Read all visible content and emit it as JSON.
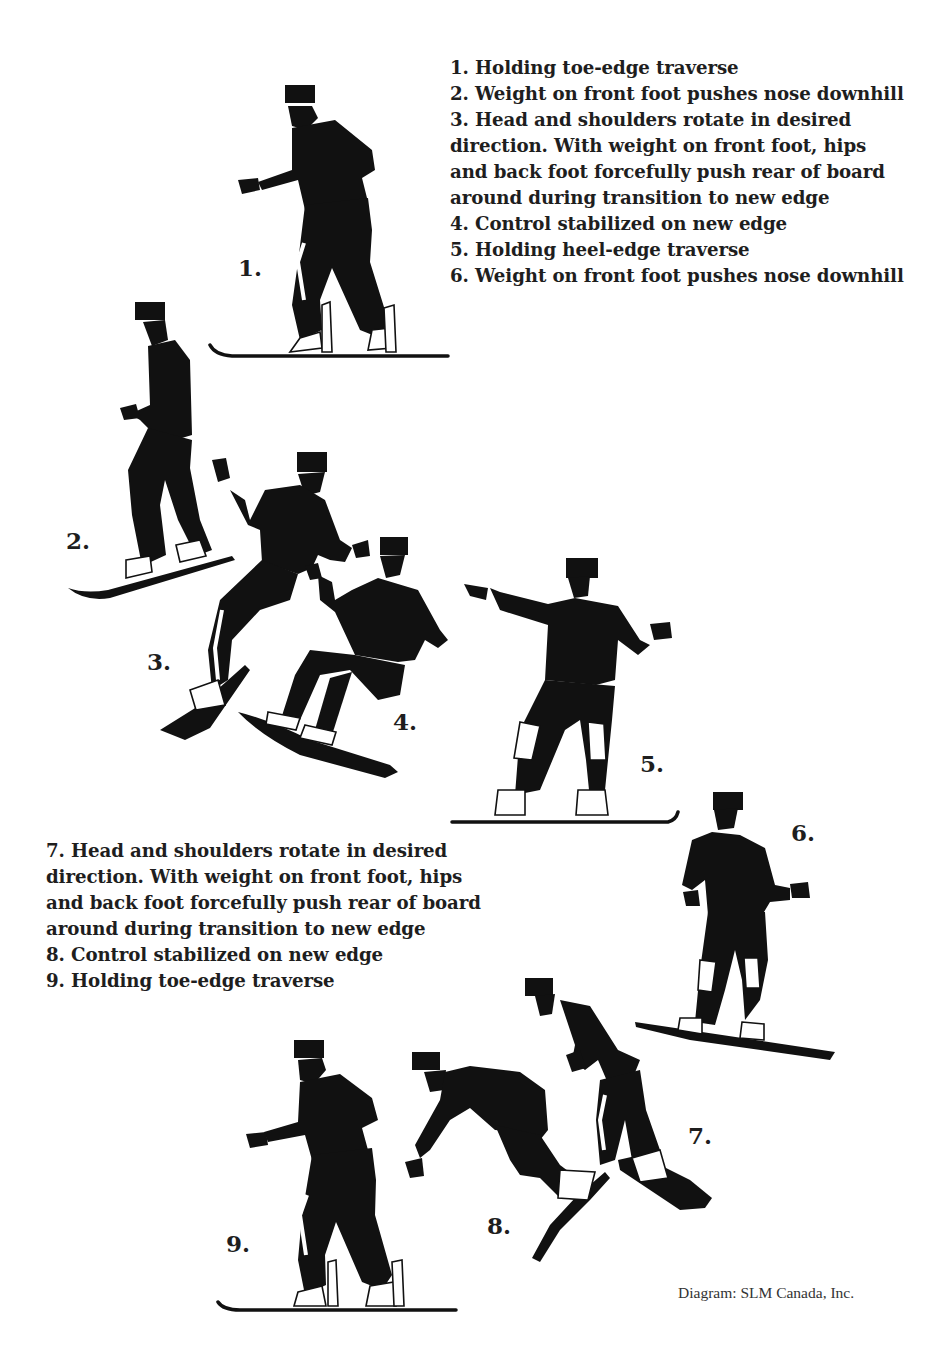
{
  "diagram": {
    "captions_top": [
      "1. Holding toe-edge traverse",
      "2. Weight on front foot pushes nose downhill",
      "3. Head and shoulders rotate in desired",
      "direction. With weight on front foot, hips",
      "and back foot forcefully push rear of board",
      "around during transition to new edge",
      "4. Control stabilized on new edge",
      "5. Holding heel-edge traverse",
      "6. Weight on front foot pushes nose downhill"
    ],
    "captions_bottom": [
      "7. Head and shoulders rotate in desired",
      "direction. With weight on front foot, hips",
      "and back foot forcefully push rear of board",
      "around during transition to new edge",
      "8. Control stabilized on new edge",
      "9. Holding toe-edge traverse"
    ],
    "steps": [
      {
        "label": "1.",
        "edge": "toe-edge traverse"
      },
      {
        "label": "2.",
        "edge": "weight on front foot"
      },
      {
        "label": "3.",
        "edge": "transition"
      },
      {
        "label": "4.",
        "edge": "new edge"
      },
      {
        "label": "5.",
        "edge": "heel-edge traverse"
      },
      {
        "label": "6.",
        "edge": "weight on front foot"
      },
      {
        "label": "7.",
        "edge": "transition"
      },
      {
        "label": "8.",
        "edge": "new edge"
      },
      {
        "label": "9.",
        "edge": "toe-edge traverse"
      }
    ],
    "credit": "Diagram: SLM Canada, Inc.",
    "colors": {
      "ink": "#111111",
      "background": "#ffffff"
    }
  }
}
